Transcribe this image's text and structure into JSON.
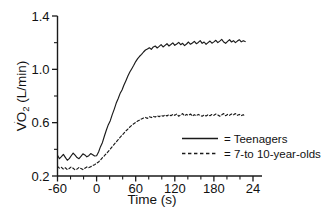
{
  "chart_data": {
    "type": "line",
    "title": "",
    "xlabel": "Time (s)",
    "ylabel": "VO₂ (L/min)",
    "ylabel_parts": {
      "v": "V",
      "dot": "˙",
      "o": "O",
      "sub": "2",
      "unit": " (L/min)"
    },
    "xlim": [
      -60,
      240
    ],
    "ylim": [
      0.2,
      1.4
    ],
    "grid": false,
    "x_ticks": [
      -60,
      0,
      60,
      120,
      180,
      240
    ],
    "x_ticklabels": [
      "-60",
      "0",
      "60",
      "120",
      "180",
      "24"
    ],
    "x_minor_ticks": [
      -40,
      -20,
      20,
      40,
      80,
      100,
      140,
      160,
      200,
      220
    ],
    "y_ticks": [
      0.2,
      0.6,
      1.0,
      1.4
    ],
    "y_ticklabels": [
      "0.2",
      "0.6",
      "1.0",
      "1.4"
    ],
    "y_minor_ticks": [
      0.4,
      0.8,
      1.2
    ],
    "legend": {
      "position": "inside-lower-right",
      "entries": [
        {
          "label": "= Teenagers",
          "style": "solid",
          "color": "#1a1a1a"
        },
        {
          "label": "= 7-to 10-year-olds",
          "style": "dashed",
          "color": "#1a1a1a"
        }
      ]
    },
    "series": [
      {
        "name": "Teenagers",
        "style": "solid",
        "color": "#1a1a1a",
        "baseline": 0.35,
        "plateau": 1.19,
        "x_end": 228,
        "x": [
          -60,
          -57,
          -54,
          -51,
          -48,
          -45,
          -42,
          -39,
          -36,
          -33,
          -30,
          -27,
          -24,
          -21,
          -18,
          -15,
          -12,
          -9,
          -6,
          -3,
          0,
          3,
          6,
          9,
          12,
          15,
          18,
          21,
          24,
          27,
          30,
          33,
          36,
          39,
          42,
          45,
          48,
          51,
          54,
          57,
          60,
          63,
          66,
          69,
          72,
          75,
          78,
          81,
          84,
          87,
          90,
          93,
          96,
          99,
          102,
          105,
          108,
          111,
          114,
          117,
          120,
          123,
          126,
          129,
          132,
          135,
          138,
          141,
          144,
          147,
          150,
          153,
          156,
          159,
          162,
          165,
          168,
          171,
          174,
          177,
          180,
          183,
          186,
          189,
          192,
          195,
          198,
          201,
          204,
          207,
          210,
          213,
          216,
          219,
          222,
          225,
          228
        ],
        "y": [
          0.355,
          0.33,
          0.345,
          0.362,
          0.34,
          0.318,
          0.33,
          0.352,
          0.372,
          0.356,
          0.338,
          0.33,
          0.348,
          0.366,
          0.358,
          0.344,
          0.352,
          0.368,
          0.36,
          0.35,
          0.352,
          0.38,
          0.42,
          0.452,
          0.5,
          0.545,
          0.585,
          0.615,
          0.66,
          0.7,
          0.745,
          0.78,
          0.818,
          0.845,
          0.882,
          0.915,
          0.95,
          0.98,
          1.005,
          1.03,
          1.058,
          1.08,
          1.098,
          1.112,
          1.13,
          1.145,
          1.152,
          1.162,
          1.15,
          1.168,
          1.175,
          1.16,
          1.172,
          1.185,
          1.168,
          1.18,
          1.192,
          1.175,
          1.186,
          1.198,
          1.18,
          1.19,
          1.202,
          1.185,
          1.195,
          1.178,
          1.19,
          1.205,
          1.188,
          1.198,
          1.21,
          1.192,
          1.202,
          1.215,
          1.195,
          1.205,
          1.188,
          1.2,
          1.212,
          1.196,
          1.206,
          1.218,
          1.2,
          1.212,
          1.225,
          1.205,
          1.195,
          1.21,
          1.222,
          1.205,
          1.215,
          1.2,
          1.212,
          1.222,
          1.206,
          1.215,
          1.208
        ]
      },
      {
        "name": "7-to 10-year-olds",
        "style": "dashed",
        "color": "#1a1a1a",
        "baseline": 0.26,
        "plateau": 0.655,
        "x_end": 228,
        "x": [
          -60,
          -57,
          -54,
          -51,
          -48,
          -45,
          -42,
          -39,
          -36,
          -33,
          -30,
          -27,
          -24,
          -21,
          -18,
          -15,
          -12,
          -9,
          -6,
          -3,
          0,
          3,
          6,
          9,
          12,
          15,
          18,
          21,
          24,
          27,
          30,
          33,
          36,
          39,
          42,
          45,
          48,
          51,
          54,
          57,
          60,
          63,
          66,
          69,
          72,
          75,
          78,
          81,
          84,
          87,
          90,
          93,
          96,
          99,
          102,
          105,
          108,
          111,
          114,
          117,
          120,
          123,
          126,
          129,
          132,
          135,
          138,
          141,
          144,
          147,
          150,
          153,
          156,
          159,
          162,
          165,
          168,
          171,
          174,
          177,
          180,
          183,
          186,
          189,
          192,
          195,
          198,
          201,
          204,
          207,
          210,
          213,
          216,
          219,
          222,
          225,
          228
        ],
        "y": [
          0.272,
          0.258,
          0.265,
          0.252,
          0.262,
          0.248,
          0.256,
          0.268,
          0.258,
          0.246,
          0.252,
          0.264,
          0.256,
          0.248,
          0.258,
          0.268,
          0.262,
          0.27,
          0.278,
          0.285,
          0.295,
          0.305,
          0.32,
          0.338,
          0.352,
          0.368,
          0.385,
          0.402,
          0.42,
          0.438,
          0.455,
          0.472,
          0.49,
          0.505,
          0.522,
          0.538,
          0.552,
          0.568,
          0.58,
          0.592,
          0.602,
          0.612,
          0.62,
          0.628,
          0.635,
          0.64,
          0.632,
          0.645,
          0.638,
          0.648,
          0.642,
          0.652,
          0.645,
          0.655,
          0.648,
          0.658,
          0.65,
          0.66,
          0.652,
          0.662,
          0.655,
          0.665,
          0.648,
          0.658,
          0.668,
          0.652,
          0.662,
          0.655,
          0.665,
          0.65,
          0.66,
          0.652,
          0.662,
          0.655,
          0.648,
          0.658,
          0.65,
          0.66,
          0.652,
          0.662,
          0.655,
          0.665,
          0.658,
          0.648,
          0.658,
          0.668,
          0.652,
          0.662,
          0.655,
          0.665,
          0.658,
          0.668,
          0.655,
          0.662,
          0.652,
          0.66,
          0.648
        ]
      }
    ]
  }
}
